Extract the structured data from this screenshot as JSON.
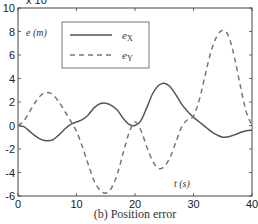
{
  "chart_data": {
    "type": "line",
    "title": "",
    "caption": "(b) Position error",
    "xlabel": "t (s)",
    "ylabel": "e (m)",
    "y_multiplier": "x 10",
    "y_multiplier_exponent": "-3",
    "xlim": [
      0,
      40
    ],
    "ylim": [
      -6,
      10
    ],
    "xticks": [
      0,
      10,
      20,
      30,
      40
    ],
    "yticks": [
      -6,
      -4,
      -2,
      0,
      2,
      4,
      6,
      8,
      10
    ],
    "grid": false,
    "legend_position": "top-left",
    "series": [
      {
        "name": "eX",
        "label_base": "e",
        "label_sub": "X",
        "style": "solid",
        "color": "#555555",
        "x": [
          0,
          1,
          2,
          3,
          4,
          5,
          6,
          7,
          8,
          9,
          10,
          11,
          12,
          13,
          14,
          15,
          16,
          17,
          18,
          19,
          20,
          21,
          22,
          23,
          24,
          25,
          26,
          27,
          28,
          29,
          30,
          31,
          32,
          33,
          34,
          35,
          36,
          37,
          38,
          39,
          40
        ],
        "y": [
          0,
          -0.1,
          -0.5,
          -0.9,
          -1.2,
          -1.3,
          -1.2,
          -0.8,
          -0.3,
          0.1,
          0.3,
          0.5,
          0.9,
          1.5,
          1.85,
          1.9,
          1.7,
          1.3,
          0.6,
          0.1,
          0.0,
          0.4,
          1.5,
          2.7,
          3.4,
          3.6,
          3.3,
          2.6,
          1.8,
          1.2,
          0.7,
          0.3,
          -0.1,
          -0.5,
          -0.8,
          -1.0,
          -0.95,
          -0.8,
          -0.6,
          -0.45,
          -0.4
        ]
      },
      {
        "name": "eY",
        "label_base": "e",
        "label_sub": "Y",
        "style": "dashed",
        "color": "#777777",
        "x": [
          0,
          1,
          2,
          3,
          4,
          5,
          6,
          7,
          8,
          9,
          10,
          11,
          12,
          13,
          14,
          15,
          16,
          17,
          18,
          19,
          20,
          21,
          22,
          23,
          24,
          25,
          26,
          27,
          28,
          29,
          30,
          31,
          32,
          33,
          34,
          35,
          36,
          37,
          38,
          39,
          40
        ],
        "y": [
          0,
          0.4,
          1.2,
          2.0,
          2.6,
          2.8,
          2.6,
          2.0,
          1.2,
          0.4,
          -0.5,
          -1.8,
          -3.3,
          -4.7,
          -5.5,
          -5.75,
          -5.3,
          -4.1,
          -2.3,
          -0.6,
          0.3,
          -0.4,
          -1.8,
          -3.0,
          -3.65,
          -3.5,
          -2.7,
          -1.4,
          -0.1,
          0.5,
          0.8,
          2.2,
          4.3,
          6.3,
          7.6,
          8.1,
          7.6,
          5.8,
          3.4,
          1.2,
          0.0
        ]
      }
    ]
  }
}
